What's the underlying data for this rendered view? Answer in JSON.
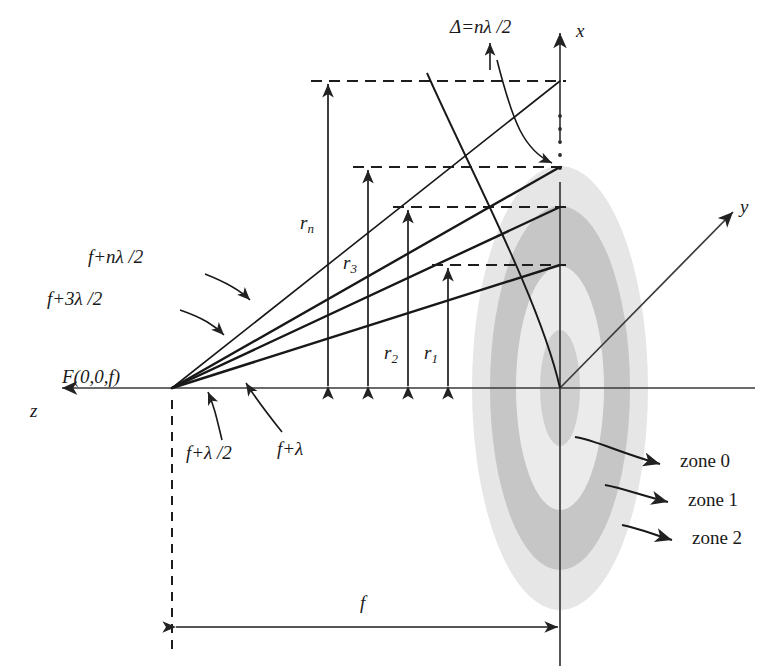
{
  "diagram": {
    "axes": [
      {
        "name": "x-axis",
        "label": "x"
      },
      {
        "name": "y-axis",
        "label": "y"
      },
      {
        "name": "z-axis",
        "label": "z"
      }
    ],
    "focal_point": {
      "label": "F(0,0,f)"
    },
    "path_labels": [
      {
        "name": "path-f-plus-n-lambda-half",
        "label": "f+nλ /2"
      },
      {
        "name": "path-f-plus-3-lambda-half",
        "label": "f+3λ /2"
      },
      {
        "name": "path-f-plus-lambda",
        "label": "f+λ"
      },
      {
        "name": "path-f-plus-lambda-half",
        "label": "f+λ /2"
      }
    ],
    "radius_labels": [
      {
        "name": "radius-rn",
        "base": "r",
        "sub": "n"
      },
      {
        "name": "radius-r3",
        "base": "r",
        "sub": "3"
      },
      {
        "name": "radius-r2",
        "base": "r",
        "sub": "2"
      },
      {
        "name": "radius-r1",
        "base": "r",
        "sub": "1"
      }
    ],
    "path_difference": {
      "label": "Δ=nλ /2"
    },
    "focal_length": {
      "label": "f"
    },
    "zones": [
      {
        "name": "zone-label-0",
        "label": "zone 0"
      },
      {
        "name": "zone-label-1",
        "label": "zone 1"
      },
      {
        "name": "zone-label-2",
        "label": "zone 2"
      }
    ],
    "colors": {
      "stroke": "#222222",
      "axis": "#3a3a3a",
      "zone_light": "#e3e3e3",
      "zone_dark": "#c2c2c2",
      "background": "#ffffff"
    }
  }
}
